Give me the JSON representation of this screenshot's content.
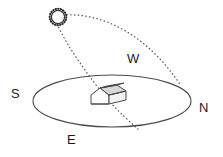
{
  "figure": {
    "type": "sun-path-diagram",
    "background_color": "#ffffff",
    "stroke_color": "#3a3a3a",
    "label_color": "#1a1a1a"
  },
  "compass": {
    "south_label": "S",
    "north_label": "N",
    "east_label": "E",
    "west_label": "W"
  },
  "elements": {
    "sun_name": "sun",
    "horizon_name": "horizon-ellipse",
    "house_name": "house",
    "arc_name": "sun-path-arc",
    "ray_name": "sun-ray-line"
  }
}
